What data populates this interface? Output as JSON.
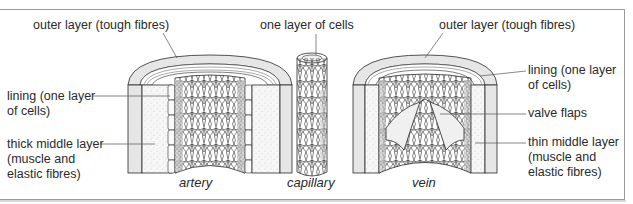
{
  "diagram": {
    "title_hint": "Structure of blood vessels",
    "colors": {
      "line": "#2a2a2a",
      "outer_layer_fill": "#e6e6e6",
      "middle_layer_fill": "#f6f6f6",
      "frame": "#9a9a9a"
    },
    "vessels": [
      {
        "id": "artery",
        "caption": "artery"
      },
      {
        "id": "capillary",
        "caption": "capillary"
      },
      {
        "id": "vein",
        "caption": "vein"
      }
    ],
    "labels": {
      "artery_outer": "outer layer (tough fibres)",
      "artery_lining_1": "lining (one layer",
      "artery_lining_2": "of cells)",
      "artery_middle_1": "thick middle layer",
      "artery_middle_2": "(muscle and",
      "artery_middle_3": "elastic fibres)",
      "capillary_wall": "one layer of cells",
      "vein_outer": "outer layer (tough fibres)",
      "vein_lining_1": "lining (one layer",
      "vein_lining_2": "of cells)",
      "vein_valve": "valve flaps",
      "vein_middle_1": "thin middle layer",
      "vein_middle_2": "(muscle and",
      "vein_middle_3": "elastic fibres)"
    }
  }
}
